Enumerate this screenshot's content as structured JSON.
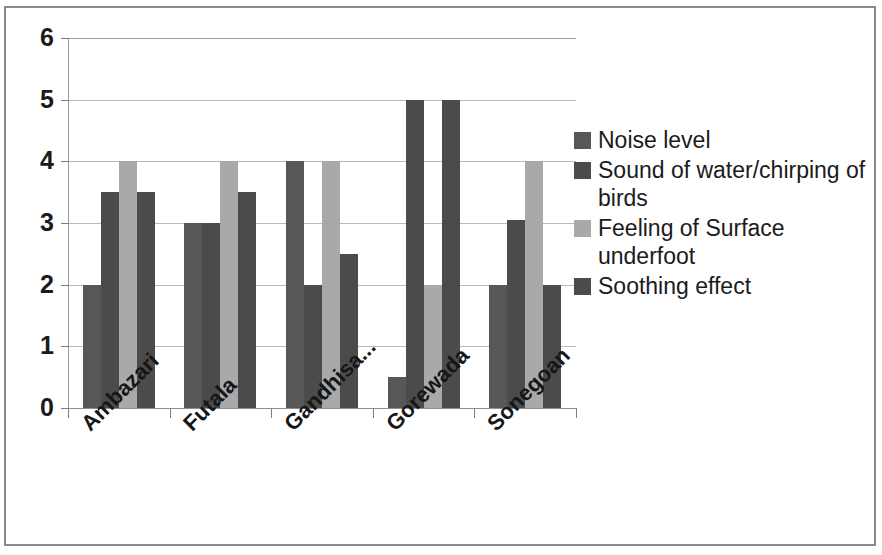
{
  "chart_data": {
    "type": "bar",
    "title": "",
    "xlabel": "",
    "ylabel": "",
    "ylim": [
      0,
      6
    ],
    "ytick_labels": [
      "6",
      "5",
      "4",
      "3",
      "2",
      "1",
      "0"
    ],
    "ytick_values": [
      6,
      5,
      4,
      3,
      2,
      1,
      0
    ],
    "grid": true,
    "legend_position": "right",
    "categories": [
      "Ambazari",
      "Futala",
      "Gandhisa...",
      "Gorewada",
      "Sonegoan"
    ],
    "series": [
      {
        "name": "Noise level",
        "color": "#575757",
        "values": [
          2,
          3,
          4,
          0.5,
          2
        ]
      },
      {
        "name": "Sound of water/chirping of birds",
        "color": "#4b4b4b",
        "values": [
          3.5,
          3,
          2,
          5,
          3.05
        ]
      },
      {
        "name": "Feeling of Surface underfoot",
        "color": "#a9a9a9",
        "values": [
          4,
          4,
          4,
          2,
          4
        ]
      },
      {
        "name": "Soothing effect",
        "color": "#4b4b4b",
        "values": [
          3.5,
          3.5,
          2.5,
          5,
          2
        ]
      }
    ]
  },
  "legend": {
    "entries": [
      {
        "label": "Noise level",
        "color": "#575757"
      },
      {
        "label": "Sound of water/chirping of birds",
        "color": "#4b4b4b"
      },
      {
        "label": "Feeling of Surface underfoot",
        "color": "#a9a9a9"
      },
      {
        "label": "Soothing effect",
        "color": "#4b4b4b"
      }
    ]
  },
  "axis": {
    "y_labels": [
      "6",
      "5",
      "4",
      "3",
      "2",
      "1",
      "0"
    ],
    "x_labels": [
      "Ambazari",
      "Futala",
      "Gandhisa...",
      "Gorewada",
      "Sonegoan"
    ]
  },
  "colors": {
    "series1": "#575757",
    "series2": "#4b4b4b",
    "series3": "#a9a9a9",
    "series4": "#4b4b4b",
    "gridline": "#b9b9b9",
    "axis": "#8f8f8f",
    "frame": "#8a8a8a",
    "text": "#1b1b1b"
  }
}
